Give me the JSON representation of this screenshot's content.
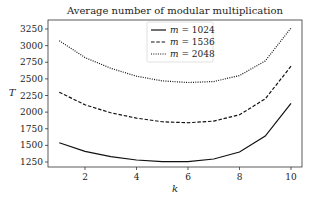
{
  "chart_data": {
    "type": "line",
    "title": "Average number of modular multiplication",
    "xlabel": "k",
    "ylabel": "T",
    "x": [
      1,
      2,
      3,
      4,
      5,
      6,
      7,
      8,
      9,
      10
    ],
    "xticks": [
      2,
      4,
      6,
      8,
      10
    ],
    "yticks": [
      1250,
      1500,
      1750,
      2000,
      2250,
      2500,
      2750,
      3000,
      3250
    ],
    "xlim": [
      0.6,
      10.4
    ],
    "ylim": [
      1180,
      3340
    ],
    "grid": false,
    "legend_position": "upper center",
    "series": [
      {
        "name": "m = 1024",
        "style": "solid",
        "values": [
          1540,
          1410,
          1330,
          1280,
          1255,
          1255,
          1295,
          1400,
          1640,
          2130
        ]
      },
      {
        "name": "m = 1536",
        "style": "dashed",
        "values": [
          2300,
          2110,
          1990,
          1910,
          1855,
          1840,
          1865,
          1960,
          2200,
          2690
        ]
      },
      {
        "name": "m = 2048",
        "style": "dotted",
        "values": [
          3075,
          2820,
          2660,
          2540,
          2470,
          2445,
          2460,
          2550,
          2770,
          3265
        ]
      }
    ]
  },
  "legend": {
    "items": [
      {
        "label_var": "m",
        "label_value": "= 1024"
      },
      {
        "label_var": "m",
        "label_value": "= 1536"
      },
      {
        "label_var": "m",
        "label_value": "= 2048"
      }
    ]
  }
}
